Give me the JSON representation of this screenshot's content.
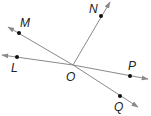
{
  "diagram": {
    "title": "",
    "colors": {
      "line": "#8a8a8a",
      "point": "#111111",
      "label": "#222222",
      "background": "#ffffff"
    },
    "center": {
      "name": "O",
      "x": 73,
      "y": 65,
      "label_x": 66,
      "label_y": 81
    },
    "rays": [
      {
        "name": "ray-OM",
        "point": "M",
        "px": 19,
        "py": 33,
        "end_x": 8,
        "end_y": 27,
        "label_x": 20,
        "label_y": 27
      },
      {
        "name": "ray-OL",
        "point": "L",
        "px": 17,
        "py": 57,
        "end_x": 2,
        "end_y": 55,
        "label_x": 11,
        "label_y": 72
      },
      {
        "name": "ray-ON",
        "point": "N",
        "px": 101,
        "py": 16,
        "end_x": 110,
        "end_y": 2,
        "label_x": 89,
        "label_y": 13
      },
      {
        "name": "ray-OP",
        "point": "P",
        "px": 130,
        "py": 76,
        "end_x": 148,
        "end_y": 79,
        "label_x": 128,
        "label_y": 70
      },
      {
        "name": "ray-OQ",
        "point": "Q",
        "px": 120,
        "py": 96,
        "end_x": 138,
        "end_y": 107,
        "label_x": 114,
        "label_y": 111
      }
    ],
    "labels": {
      "M": "M",
      "L": "L",
      "N": "N",
      "P": "P",
      "Q": "Q",
      "O": "O"
    }
  }
}
